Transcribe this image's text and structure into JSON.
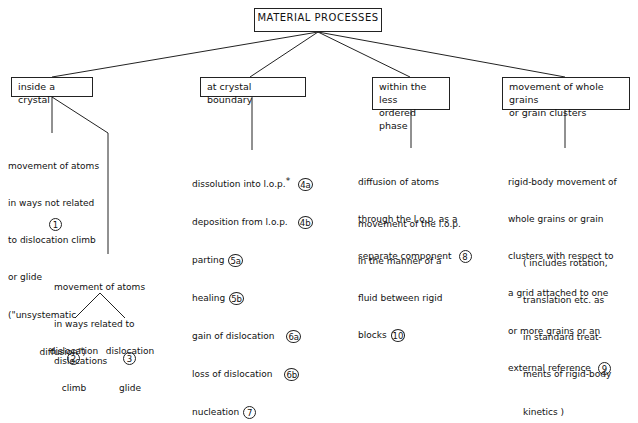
{
  "title": "MATERIAL PROCESSES",
  "categories": [
    {
      "label": "inside a crystal",
      "children": {
        "unrelated": {
          "lines": [
            "movement of atoms",
            "in ways not related",
            "to dislocation climb",
            "or glide",
            "(\"unsystematic",
            "           diffusion\")"
          ],
          "marker": "1"
        },
        "related": {
          "lines": [
            "movement of atoms",
            "in ways related to",
            "dislocations"
          ],
          "sub": [
            {
              "lines": [
                "dislocation",
                "climb"
              ],
              "marker": "2"
            },
            {
              "lines": [
                "dislocation",
                "glide"
              ],
              "marker": "3"
            }
          ]
        }
      }
    },
    {
      "label": "at crystal boundary",
      "items": [
        {
          "text": "dissolution into l.o.p.",
          "asterisk": "*",
          "marker": "4a"
        },
        {
          "text": "deposition from l.o.p.",
          "marker": "4b"
        },
        {
          "text": "parting",
          "marker": "5a"
        },
        {
          "text": "healing",
          "marker": "5b"
        },
        {
          "text": "gain of dislocation",
          "marker": "6a"
        },
        {
          "text": "loss of dislocation",
          "marker": "6b"
        },
        {
          "text": "nucleation",
          "marker": "7"
        }
      ]
    },
    {
      "label_lines": [
        "within the less",
        "ordered phase"
      ],
      "items": [
        {
          "lines": [
            "diffusion of atoms",
            "through the l.o.p. as a",
            "separate component"
          ],
          "marker": "8"
        },
        {
          "lines": [
            "movement of the l.o.p.",
            "in the manner of a",
            "fluid between rigid",
            "blocks"
          ],
          "marker": "10"
        }
      ]
    },
    {
      "label_lines": [
        "movement of whole grains",
        "or grain clusters"
      ],
      "items": [
        {
          "lines": [
            "rigid-body movement of",
            "whole grains or grain",
            "clusters with respect to",
            "a grid attached to one",
            "or more grains or an",
            "external reference"
          ],
          "marker": "9"
        }
      ],
      "note_lines": [
        "( includes rotation,",
        "translation etc. as",
        "in standard treat-",
        "ments of rigid-body",
        "kinetics )"
      ]
    }
  ]
}
